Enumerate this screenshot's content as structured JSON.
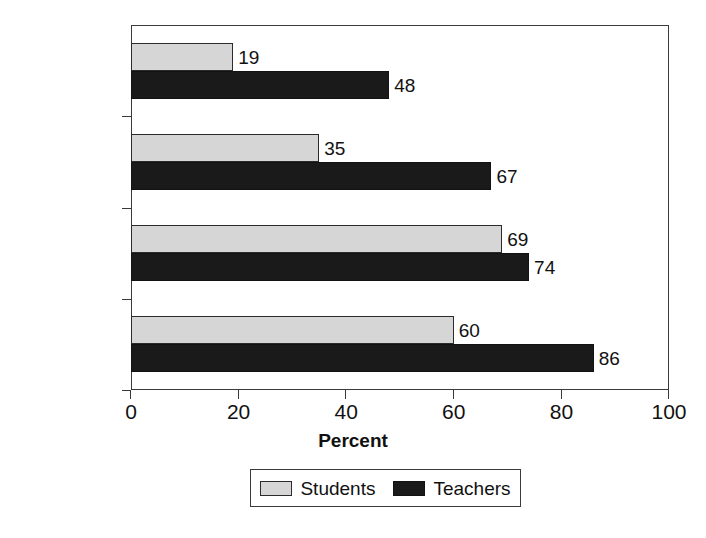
{
  "chart_data": {
    "type": "bar",
    "orientation": "horizontal",
    "title": "",
    "xlabel": "Percent",
    "ylabel": "",
    "xlim": [
      0,
      100
    ],
    "xticks": [
      0,
      20,
      40,
      60,
      80,
      100
    ],
    "xticklabels": [
      "0",
      "20",
      "40",
      "60",
      "80",
      "100"
    ],
    "categories": [
      "All",
      "English",
      "Math",
      "Science"
    ],
    "grid": false,
    "legend_position": "bottom",
    "series": [
      {
        "name": "Students",
        "color": "#d6d6d6",
        "values": [
          19,
          35,
          69,
          60
        ],
        "labels": [
          "19",
          "35",
          "69",
          "60"
        ]
      },
      {
        "name": "Teachers",
        "color": "#1a1a1a",
        "values": [
          48,
          67,
          74,
          86
        ],
        "labels": [
          "48",
          "67",
          "74",
          "86"
        ]
      }
    ]
  },
  "legend": {
    "entries": [
      {
        "label": "Students",
        "swatch": "students"
      },
      {
        "label": "Teachers",
        "swatch": "teachers"
      }
    ]
  },
  "icons": {
    "students_swatch": "legend-swatch-light",
    "teachers_swatch": "legend-swatch-dark"
  }
}
